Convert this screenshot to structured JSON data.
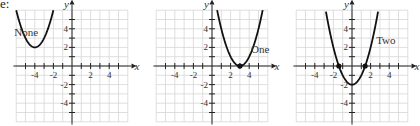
{
  "lead_text": "e:",
  "chart_data": [
    {
      "type": "line",
      "title": "",
      "label": "None",
      "function": "y = (x + 4)^2 + 2",
      "vertex": [
        -4,
        2
      ],
      "x_intercepts": [],
      "xlabel": "x",
      "ylabel": "y",
      "xlim": [
        -6,
        6
      ],
      "ylim": [
        -6,
        6
      ],
      "x_ticks": [
        "-4",
        "-2",
        "2",
        "4"
      ],
      "y_ticks": [
        "4",
        "2",
        "-2",
        "-4"
      ],
      "grid": true
    },
    {
      "type": "line",
      "title": "",
      "label": "One",
      "function": "y = (x - 3)^2",
      "vertex": [
        3,
        0
      ],
      "x_intercepts": [
        3
      ],
      "xlabel": "x",
      "ylabel": "y",
      "xlim": [
        -6,
        6
      ],
      "ylim": [
        -6,
        6
      ],
      "x_ticks": [
        "-4",
        "-2",
        "2",
        "4"
      ],
      "y_ticks": [
        "4",
        "2",
        "-2",
        "-4"
      ],
      "grid": true
    },
    {
      "type": "line",
      "title": "",
      "label": "Two",
      "function": "y = x^2 - 2",
      "vertex": [
        0,
        -2
      ],
      "x_intercepts": [
        -1.41,
        1.41
      ],
      "xlabel": "x",
      "ylabel": "y",
      "xlim": [
        -6,
        6
      ],
      "ylim": [
        -6,
        6
      ],
      "x_ticks": [
        "-4",
        "-2",
        "2",
        "4"
      ],
      "y_ticks": [
        "4",
        "2",
        "-2",
        "-4"
      ],
      "grid": true
    }
  ]
}
